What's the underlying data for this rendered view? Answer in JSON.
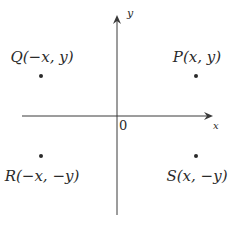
{
  "diagram": {
    "type": "coordinate-plane",
    "axes": {
      "x_label": "x",
      "y_label": "y",
      "origin_label": "0"
    },
    "points": [
      {
        "name": "P",
        "label": "P(x, y)",
        "quadrant": "I"
      },
      {
        "name": "Q",
        "label": "Q(−x, y)",
        "quadrant": "II"
      },
      {
        "name": "R",
        "label": "R(−x, −y)",
        "quadrant": "III"
      },
      {
        "name": "S",
        "label": "S(x, −y)",
        "quadrant": "IV"
      }
    ],
    "colors": {
      "line": "#3a3a3a",
      "text": "#2a2a2a",
      "background": "#ffffff"
    }
  }
}
